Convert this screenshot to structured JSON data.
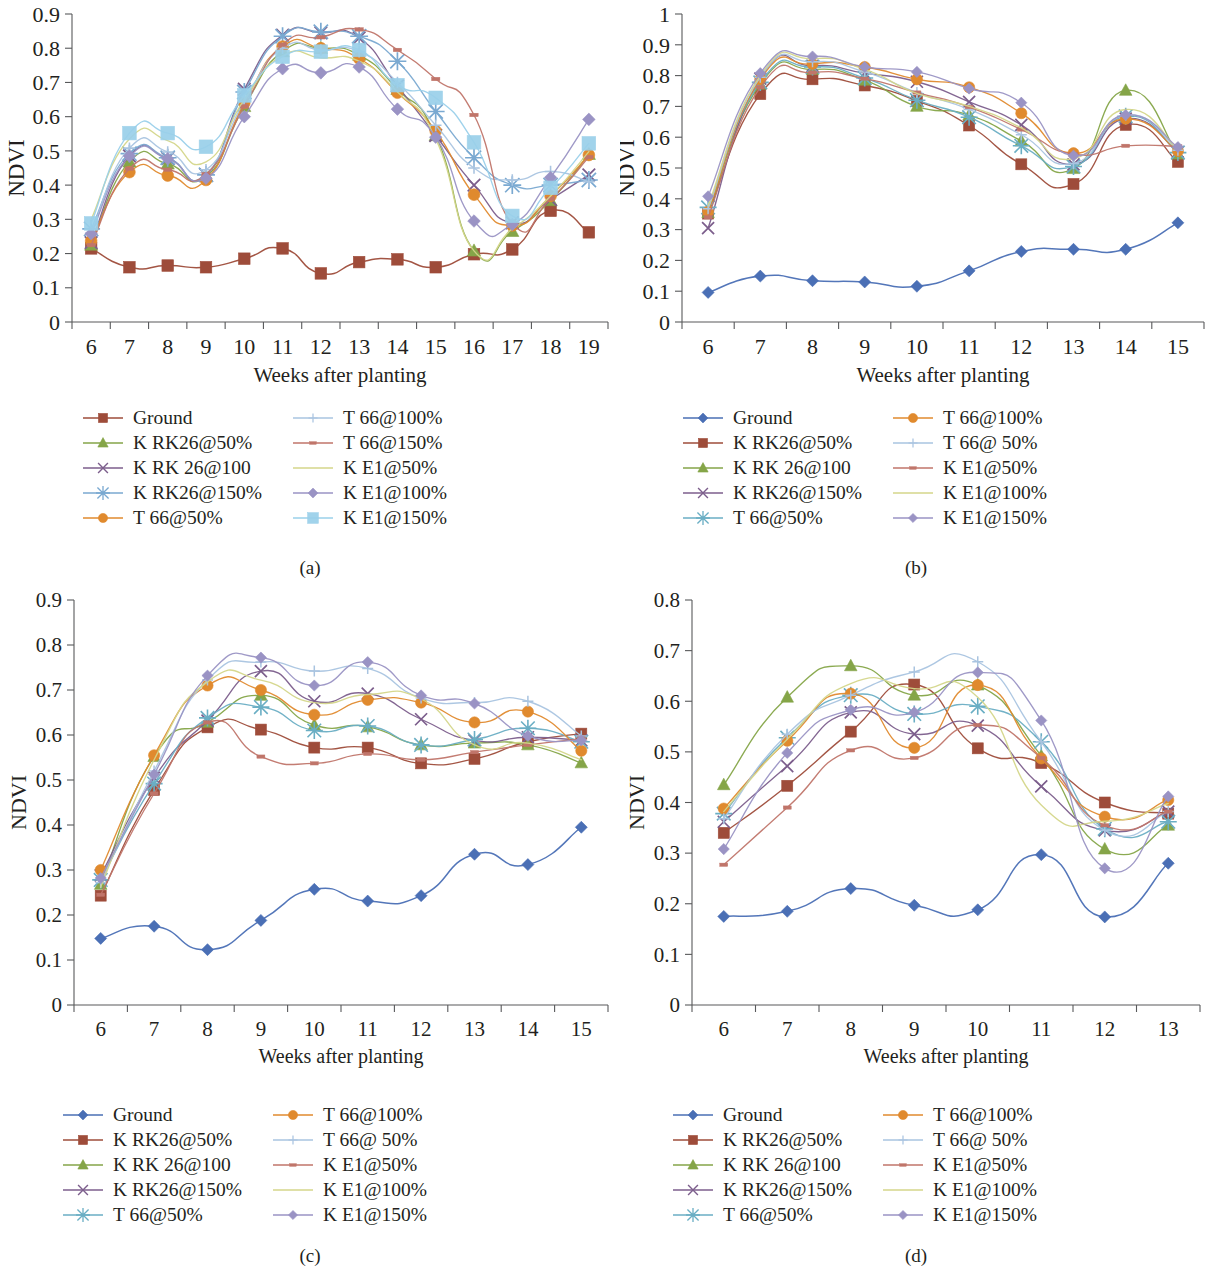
{
  "figure": {
    "panels": [
      {
        "caption": "(a)"
      },
      {
        "caption": "(b)"
      },
      {
        "caption": "(c)"
      },
      {
        "caption": "(d)"
      }
    ]
  },
  "colors": {
    "ground_brown": "#9e4c3a",
    "ground_blue": "#4a6fb5",
    "olive_green": "#85a548",
    "purple": "#7c5e8c",
    "sky_blue": "#7aa9d1",
    "orange": "#e08a2e",
    "pale_blue": "#a9c4e0",
    "salmon": "#c0756a",
    "pale_yellow": "#d4d68a",
    "lavender": "#9a93c4",
    "light_blue_square": "#9ad0ea",
    "teal": "#6aaec4"
  },
  "chart_data": [
    {
      "panel": "a",
      "type": "line",
      "title": "",
      "xlabel": "Weeks after planting",
      "ylabel": "NDVI",
      "x": [
        6,
        7,
        8,
        9,
        10,
        11,
        12,
        13,
        14,
        15,
        16,
        17,
        18,
        19
      ],
      "xlim": [
        5.5,
        19.5
      ],
      "ylim": [
        0,
        0.9
      ],
      "yticks": [
        0,
        0.1,
        0.2,
        0.3,
        0.4,
        0.5,
        0.6,
        0.7,
        0.8,
        0.9
      ],
      "yticklabels": [
        "0",
        "0.1",
        "0.2",
        "0.3",
        "0.4",
        "0.5",
        "0.6",
        "0.7",
        "0.8",
        "0.9"
      ],
      "xticklabels": [
        "6",
        "7",
        "8",
        "9",
        "10",
        "11",
        "12",
        "13",
        "14",
        "15",
        "16",
        "17",
        "18",
        "19"
      ],
      "grid": false,
      "legend_position": "below",
      "series": [
        {
          "name": "Ground",
          "marker": "square",
          "color": "#9e4c3a",
          "values": [
            0.215,
            0.16,
            0.165,
            0.16,
            0.185,
            0.215,
            0.142,
            0.175,
            0.183,
            0.16,
            0.198,
            0.212,
            0.325,
            0.262
          ]
        },
        {
          "name": "K RK26@50%",
          "marker": "triangle",
          "color": "#85a548",
          "values": [
            0.225,
            0.468,
            0.462,
            0.425,
            0.63,
            0.79,
            0.8,
            0.78,
            0.68,
            0.545,
            0.208,
            0.265,
            0.355,
            0.49
          ]
        },
        {
          "name": "K RK 26@100",
          "marker": "x",
          "color": "#7c5e8c",
          "values": [
            0.232,
            0.485,
            0.478,
            0.43,
            0.68,
            0.838,
            0.845,
            0.83,
            0.69,
            0.545,
            0.4,
            0.29,
            0.358,
            0.43
          ]
        },
        {
          "name": "K RK26@150%",
          "marker": "star",
          "color": "#7aa9d1",
          "values": [
            0.272,
            0.492,
            0.48,
            0.43,
            0.672,
            0.835,
            0.848,
            0.835,
            0.762,
            0.615,
            0.48,
            0.4,
            0.4,
            0.415
          ]
        },
        {
          "name": "T 66@50%",
          "marker": "circle",
          "color": "#e08a2e",
          "values": [
            0.237,
            0.438,
            0.428,
            0.415,
            0.64,
            0.805,
            0.8,
            0.77,
            0.67,
            0.558,
            0.372,
            0.282,
            0.368,
            0.488
          ]
        },
        {
          "name": "T 66@100%",
          "marker": "plus",
          "color": "#a9c4e0",
          "values": [
            0.26,
            0.508,
            0.497,
            0.445,
            0.645,
            0.8,
            0.795,
            0.79,
            0.7,
            0.575,
            0.45,
            0.415,
            0.44,
            0.41
          ]
        },
        {
          "name": "T 66@150%",
          "marker": "dash",
          "color": "#c0756a",
          "values": [
            0.225,
            0.448,
            0.445,
            0.432,
            0.63,
            0.81,
            0.832,
            0.855,
            0.795,
            0.71,
            0.605,
            0.288,
            0.36,
            0.482
          ]
        },
        {
          "name": "K E1@50%",
          "marker": "line",
          "color": "#d4d68a",
          "values": [
            0.3,
            0.535,
            0.53,
            0.468,
            0.65,
            0.778,
            0.772,
            0.762,
            0.672,
            0.535,
            0.208,
            0.272,
            0.368,
            0.498
          ]
        },
        {
          "name": "K E1@100%",
          "marker": "diamond",
          "color": "#9a93c4",
          "values": [
            0.258,
            0.485,
            0.477,
            0.42,
            0.6,
            0.74,
            0.728,
            0.745,
            0.622,
            0.54,
            0.295,
            0.285,
            0.422,
            0.592
          ]
        },
        {
          "name": "K E1@150%",
          "marker": "square-lg",
          "color": "#9ad0ea",
          "values": [
            0.288,
            0.552,
            0.552,
            0.512,
            0.662,
            0.775,
            0.79,
            0.795,
            0.692,
            0.655,
            0.525,
            0.31,
            0.392,
            0.522
          ]
        }
      ]
    },
    {
      "panel": "b",
      "type": "line",
      "title": "",
      "xlabel": "Weeks after planting",
      "ylabel": "NDVI",
      "x": [
        6,
        7,
        8,
        9,
        10,
        11,
        12,
        13,
        14,
        15
      ],
      "xlim": [
        5.5,
        15.5
      ],
      "ylim": [
        0,
        1
      ],
      "yticks": [
        0,
        0.1,
        0.2,
        0.3,
        0.4,
        0.5,
        0.6,
        0.7,
        0.8,
        0.9,
        1
      ],
      "yticklabels": [
        "0",
        "0.1",
        "0.2",
        "0.3",
        "0.4",
        "0.5",
        "0.6",
        "0.7",
        "0.8",
        "0.9",
        "1"
      ],
      "xticklabels": [
        "6",
        "7",
        "8",
        "9",
        "10",
        "11",
        "12",
        "13",
        "14",
        "15"
      ],
      "grid": false,
      "legend_position": "below",
      "series": [
        {
          "name": "Ground",
          "marker": "diamond",
          "color": "#4a6fb5",
          "values": [
            0.096,
            0.149,
            0.134,
            0.13,
            0.116,
            0.166,
            0.229,
            0.236,
            0.236,
            0.322
          ]
        },
        {
          "name": "K RK26@50%",
          "marker": "square",
          "color": "#9e4c3a",
          "values": [
            0.352,
            0.74,
            0.788,
            0.768,
            0.718,
            0.638,
            0.512,
            0.448,
            0.64,
            0.52
          ]
        },
        {
          "name": "K RK 26@100",
          "marker": "triangle",
          "color": "#85a548",
          "values": [
            0.355,
            0.772,
            0.82,
            0.785,
            0.7,
            0.672,
            0.588,
            0.498,
            0.752,
            0.545
          ]
        },
        {
          "name": "K RK26@150%",
          "marker": "x",
          "color": "#7c5e8c",
          "values": [
            0.305,
            0.79,
            0.832,
            0.808,
            0.78,
            0.715,
            0.64,
            0.512,
            0.66,
            0.552
          ]
        },
        {
          "name": "T 66@50%",
          "marker": "star",
          "color": "#6aaec4",
          "values": [
            0.372,
            0.778,
            0.828,
            0.792,
            0.72,
            0.665,
            0.572,
            0.505,
            0.668,
            0.55
          ]
        },
        {
          "name": "T 66@100%",
          "marker": "circle",
          "color": "#e08a2e",
          "values": [
            0.358,
            0.788,
            0.838,
            0.828,
            0.788,
            0.762,
            0.678,
            0.548,
            0.66,
            0.555
          ]
        },
        {
          "name": "T 66@ 50%",
          "marker": "plus",
          "color": "#a9c4e0",
          "values": [
            0.368,
            0.795,
            0.845,
            0.812,
            0.745,
            0.69,
            0.608,
            0.515,
            0.672,
            0.558
          ]
        },
        {
          "name": "K E1@50%",
          "marker": "dash",
          "color": "#c0756a",
          "values": [
            0.34,
            0.762,
            0.81,
            0.79,
            0.745,
            0.698,
            0.625,
            0.545,
            0.572,
            0.57
          ]
        },
        {
          "name": "K E1@100%",
          "marker": "line",
          "color": "#d4d68a",
          "values": [
            0.378,
            0.8,
            0.855,
            0.82,
            0.742,
            0.7,
            0.63,
            0.53,
            0.69,
            0.56
          ]
        },
        {
          "name": "K E1@150%",
          "marker": "diamond-l",
          "color": "#9a93c4",
          "values": [
            0.408,
            0.808,
            0.862,
            0.828,
            0.812,
            0.758,
            0.712,
            0.54,
            0.672,
            0.568
          ]
        }
      ]
    },
    {
      "panel": "c",
      "type": "line",
      "title": "",
      "xlabel": "Weeks after planting",
      "ylabel": "NDVI",
      "x": [
        6,
        7,
        8,
        9,
        10,
        11,
        12,
        13,
        14,
        15
      ],
      "xlim": [
        5.5,
        15.5
      ],
      "ylim": [
        0,
        0.9
      ],
      "yticks": [
        0,
        0.1,
        0.2,
        0.3,
        0.4,
        0.5,
        0.6,
        0.7,
        0.8,
        0.9
      ],
      "yticklabels": [
        "0",
        "0.1",
        "0.2",
        "0.3",
        "0.4",
        "0.5",
        "0.6",
        "0.7",
        "0.8",
        "0.9"
      ],
      "xticklabels": [
        "6",
        "7",
        "8",
        "9",
        "10",
        "11",
        "12",
        "13",
        "14",
        "15"
      ],
      "grid": false,
      "legend_position": "below",
      "series": [
        {
          "name": "Ground",
          "marker": "diamond",
          "color": "#4a6fb5",
          "values": [
            0.148,
            0.175,
            0.123,
            0.188,
            0.257,
            0.231,
            0.243,
            0.335,
            0.312,
            0.395
          ]
        },
        {
          "name": "K RK26@50%",
          "marker": "square",
          "color": "#9e4c3a",
          "values": [
            0.243,
            0.478,
            0.617,
            0.612,
            0.572,
            0.572,
            0.537,
            0.547,
            0.585,
            0.603
          ]
        },
        {
          "name": "K RK 26@100",
          "marker": "triangle",
          "color": "#85a548",
          "values": [
            0.268,
            0.552,
            0.628,
            0.688,
            0.622,
            0.618,
            0.578,
            0.582,
            0.578,
            0.538
          ]
        },
        {
          "name": "K RK26@150%",
          "marker": "x",
          "color": "#7c5e8c",
          "values": [
            0.288,
            0.505,
            0.632,
            0.742,
            0.675,
            0.692,
            0.635,
            0.588,
            0.595,
            0.588
          ]
        },
        {
          "name": "T 66@50%",
          "marker": "star",
          "color": "#6aaec4",
          "values": [
            0.278,
            0.492,
            0.638,
            0.662,
            0.61,
            0.62,
            0.578,
            0.59,
            0.615,
            0.585
          ]
        },
        {
          "name": "T 66@100%",
          "marker": "circle",
          "color": "#e08a2e",
          "values": [
            0.3,
            0.555,
            0.71,
            0.7,
            0.645,
            0.678,
            0.672,
            0.628,
            0.652,
            0.565
          ]
        },
        {
          "name": "T 66@ 50%",
          "marker": "plus",
          "color": "#a9c4e0",
          "values": [
            0.272,
            0.52,
            0.722,
            0.762,
            0.742,
            0.748,
            0.682,
            0.672,
            0.675,
            0.598
          ]
        },
        {
          "name": "K E1@50%",
          "marker": "dash",
          "color": "#c0756a",
          "values": [
            0.245,
            0.47,
            0.628,
            0.552,
            0.537,
            0.558,
            0.545,
            0.562,
            0.578,
            0.592
          ]
        },
        {
          "name": "K E1@100%",
          "marker": "line",
          "color": "#d4d68a",
          "values": [
            0.262,
            0.545,
            0.718,
            0.722,
            0.672,
            0.69,
            0.68,
            0.578,
            0.582,
            0.545
          ]
        },
        {
          "name": "K E1@150%",
          "marker": "diamond-l",
          "color": "#9a93c4",
          "values": [
            0.282,
            0.512,
            0.732,
            0.772,
            0.71,
            0.762,
            0.688,
            0.67,
            0.598,
            0.588
          ]
        }
      ]
    },
    {
      "panel": "d",
      "type": "line",
      "title": "",
      "xlabel": "Weeks after planting",
      "ylabel": "NDVI",
      "x": [
        6,
        7,
        8,
        9,
        10,
        11,
        12,
        13
      ],
      "xlim": [
        5.5,
        13.5
      ],
      "ylim": [
        0,
        0.8
      ],
      "yticks": [
        0,
        0.1,
        0.2,
        0.3,
        0.4,
        0.5,
        0.6,
        0.7,
        0.8
      ],
      "yticklabels": [
        "0",
        "0.1",
        "0.2",
        "0.3",
        "0.4",
        "0.5",
        "0.6",
        "0.7",
        "0.8"
      ],
      "xticklabels": [
        "6",
        "7",
        "8",
        "9",
        "10",
        "11",
        "12",
        "13"
      ],
      "grid": false,
      "legend_position": "below",
      "series": [
        {
          "name": "Ground",
          "marker": "diamond",
          "color": "#4a6fb5",
          "values": [
            0.175,
            0.185,
            0.23,
            0.197,
            0.188,
            0.297,
            0.174,
            0.28
          ]
        },
        {
          "name": "K RK26@50%",
          "marker": "square",
          "color": "#9e4c3a",
          "values": [
            0.34,
            0.433,
            0.54,
            0.633,
            0.507,
            0.478,
            0.4,
            0.378
          ]
        },
        {
          "name": "K RK 26@100",
          "marker": "triangle",
          "color": "#85a548",
          "values": [
            0.435,
            0.608,
            0.67,
            0.612,
            0.632,
            0.492,
            0.308,
            0.355
          ]
        },
        {
          "name": "K RK26@150%",
          "marker": "x",
          "color": "#7c5e8c",
          "values": [
            0.362,
            0.472,
            0.578,
            0.535,
            0.552,
            0.432,
            0.345,
            0.382
          ]
        },
        {
          "name": "T 66@50%",
          "marker": "star",
          "color": "#6aaec4",
          "values": [
            0.378,
            0.528,
            0.612,
            0.575,
            0.59,
            0.52,
            0.348,
            0.362
          ]
        },
        {
          "name": "T 66@100%",
          "marker": "circle",
          "color": "#e08a2e",
          "values": [
            0.388,
            0.522,
            0.615,
            0.508,
            0.632,
            0.487,
            0.372,
            0.405
          ]
        },
        {
          "name": "T 66@ 50%",
          "marker": "plus",
          "color": "#a9c4e0",
          "values": [
            0.368,
            0.535,
            0.612,
            0.658,
            0.678,
            0.52,
            0.345,
            0.382
          ]
        },
        {
          "name": "K E1@50%",
          "marker": "dash",
          "color": "#c0756a",
          "values": [
            0.277,
            0.39,
            0.503,
            0.488,
            0.553,
            0.488,
            0.355,
            0.382
          ]
        },
        {
          "name": "K E1@100%",
          "marker": "line",
          "color": "#d4d68a",
          "values": [
            0.382,
            0.525,
            0.635,
            0.625,
            0.608,
            0.395,
            0.363,
            0.398
          ]
        },
        {
          "name": "K E1@150%",
          "marker": "diamond-l",
          "color": "#9a93c4",
          "values": [
            0.308,
            0.498,
            0.583,
            0.578,
            0.657,
            0.562,
            0.27,
            0.412
          ]
        }
      ]
    }
  ]
}
